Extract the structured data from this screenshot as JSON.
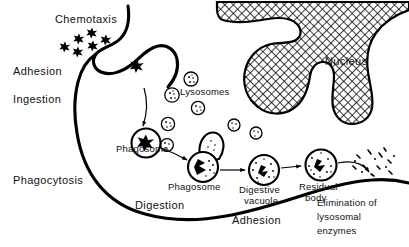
{
  "figure": {
    "background_color": "#ffffff",
    "ink_color": "#000000"
  },
  "labels": {
    "chemotaxis": "Chemotaxis",
    "adhesion_left": "Adhesion",
    "ingestion": "Ingestion",
    "phagocytosis": "Phagocytosis",
    "nucleus": "Nucleus",
    "lysosomes": "Lysosomes",
    "phagosome_1": "Phagosome",
    "phagosome_2": "Phagosome",
    "digestive_vacuole_line1": "Digestive",
    "digestive_vacuole_line2": "vacuole",
    "residual_body_line1": "Residual",
    "residual_body_line2": "body",
    "digestion": "Digestion",
    "adhesion_bottom": "Adhesion",
    "elimination_line1": "Elimination of",
    "elimination_line2": "lysosomal",
    "elimination_line3": "enzymes"
  },
  "structures": {
    "cell_membrane": "phagocyte-cell-membrane",
    "nucleus_shape": "lobed-crosshatched-nucleus",
    "bacteria_cluster_count": 6,
    "free_lysosome_count": 6,
    "stages": [
      "chemotaxis",
      "adhesion",
      "ingestion",
      "phagosome-formation",
      "phagosome-lysosome-fusion",
      "digestive-vacuole",
      "residual-body",
      "elimination"
    ]
  }
}
